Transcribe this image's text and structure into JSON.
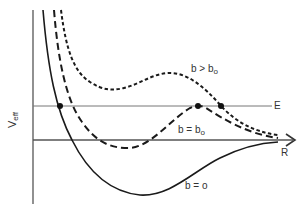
{
  "figure": {
    "y_axis_label": "V",
    "y_axis_label_sub": "eff",
    "x_axis_label": "R",
    "energy_line_label": "E",
    "curves": [
      {
        "id": "b-zero",
        "label": "b = ",
        "label_sub": "o",
        "style": "solid"
      },
      {
        "id": "b-critical",
        "label": "b = b",
        "label_sub": "o",
        "style": "long-dash"
      },
      {
        "id": "b-greater",
        "label": "b > b",
        "label_sub": "o",
        "style": "short-dash"
      }
    ],
    "intersection_points": [
      {
        "curve": "b-zero",
        "description": "turning point on E line"
      },
      {
        "curve": "b-critical",
        "description": "tangent maximum at E"
      },
      {
        "curve": "b-greater",
        "description": "turning point on E line"
      }
    ],
    "colors": {
      "ink": "#1a1a1a",
      "axis": "#555555",
      "background": "#ffffff"
    }
  }
}
